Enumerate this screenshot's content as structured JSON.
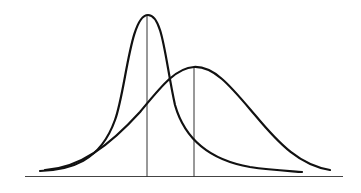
{
  "diagram": {
    "type": "overlapping-distributions",
    "colors": {
      "background": "#ffffff",
      "stroke": "#111111",
      "line": "#333333"
    },
    "curves": [
      {
        "name": "narrow-peaked-curve",
        "peak": {
          "x": 148,
          "y": 15
        },
        "start": {
          "x": 40,
          "y": 171
        },
        "end": {
          "x": 302,
          "y": 172
        }
      },
      {
        "name": "wide-curve",
        "peak": {
          "x": 194,
          "y": 67
        },
        "start": {
          "x": 45,
          "y": 170
        },
        "end": {
          "x": 330,
          "y": 170
        }
      }
    ],
    "peak_lines": [
      {
        "name": "narrow-peak-line",
        "x": 147,
        "y_top": 15,
        "y_bottom": 177
      },
      {
        "name": "wide-peak-line",
        "x": 194,
        "y_top": 67,
        "y_bottom": 177
      }
    ],
    "baseline": {
      "x1": 25,
      "x2": 343,
      "y": 176
    }
  }
}
